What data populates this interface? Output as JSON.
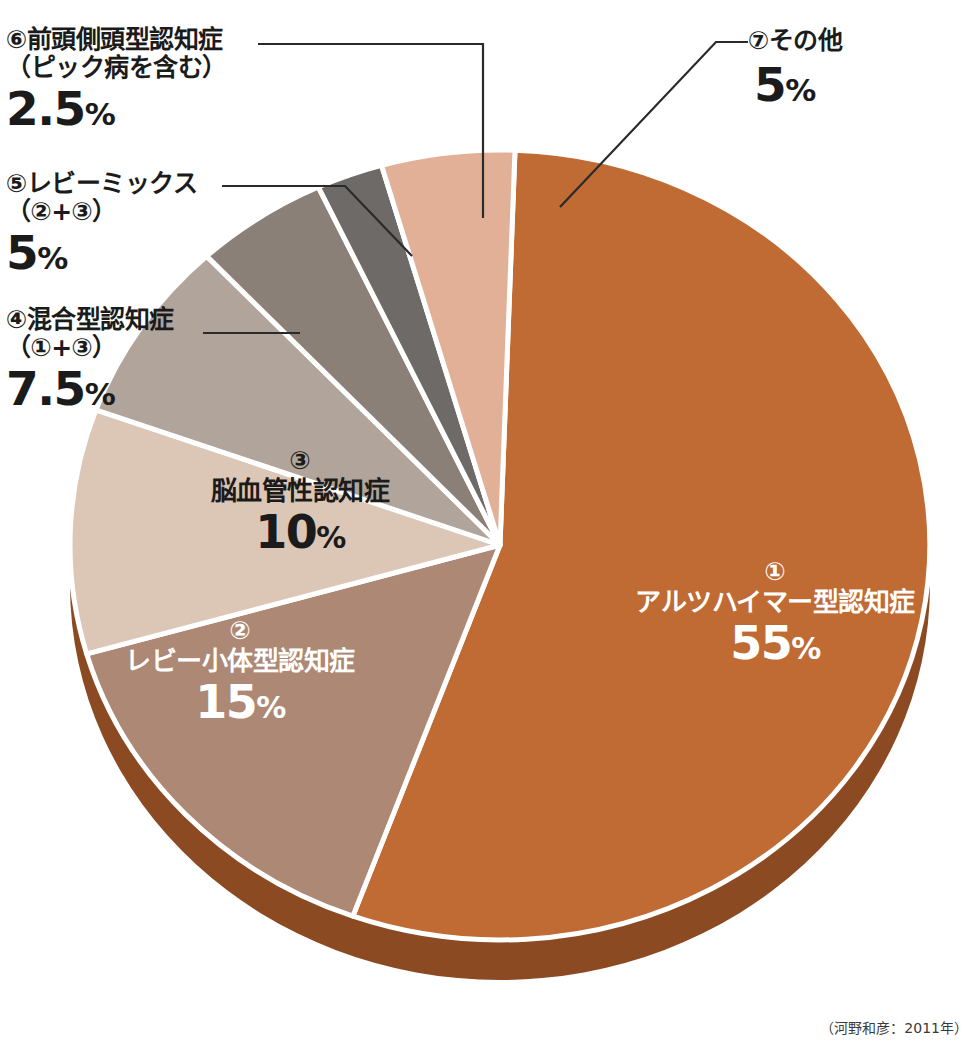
{
  "chart_data": {
    "type": "pie",
    "title": "",
    "subtitle": "",
    "xlabel": "",
    "ylabel": "",
    "legend_position": "none",
    "grid": false,
    "units": "%",
    "source": "（河野和彦：2011年）",
    "categories": [
      "①アルツハイマー型認知症",
      "②レビー小体型認知症",
      "③脳血管性認知症",
      "④混合型認知症（①+③）",
      "⑤レビーミックス（②+③）",
      "⑥前頭側頭型認知症（ピック病を含む）",
      "⑦その他"
    ],
    "values": [
      55,
      15,
      10,
      7.5,
      5,
      2.5,
      5
    ],
    "colors": [
      "#C06A34",
      "#AC8875",
      "#DCC6B6",
      "#B1A49B",
      "#8B8078",
      "#6E6A68",
      "#E1B096"
    ],
    "slices": [
      {
        "index": "①",
        "name": "アルツハイマー型認知症",
        "value": 55,
        "value_text": "55",
        "pct_symbol": "%",
        "color": "#C06A34",
        "label_placement": "inside",
        "label_color": "#ffffff"
      },
      {
        "index": "②",
        "name": "レビー小体型認知症",
        "value": 15,
        "value_text": "15",
        "pct_symbol": "%",
        "color": "#AC8875",
        "label_placement": "inside",
        "label_color": "#ffffff"
      },
      {
        "index": "③",
        "name": "脳血管性認知症",
        "value": 10,
        "value_text": "10",
        "pct_symbol": "%",
        "color": "#DCC6B6",
        "label_placement": "inside",
        "label_color": "#1b1b1b"
      },
      {
        "index": "④",
        "name": "混合型認知症",
        "name_line2": "（①+③）",
        "value": 7.5,
        "value_text": "7.5",
        "pct_symbol": "%",
        "color": "#B1A49B",
        "label_placement": "outside-left",
        "label_color": "#1b1b1b"
      },
      {
        "index": "⑤",
        "name": "レビーミックス",
        "name_line2": "（②+③）",
        "value": 5,
        "value_text": "5",
        "pct_symbol": "%",
        "color": "#8B8078",
        "label_placement": "outside-left",
        "label_color": "#1b1b1b"
      },
      {
        "index": "⑥",
        "name": "前頭側頭型認知症",
        "name_line2": "（ピック病を含む）",
        "value": 2.5,
        "value_text": "2.5",
        "pct_symbol": "%",
        "color": "#6E6A68",
        "label_placement": "outside-left",
        "label_color": "#1b1b1b"
      },
      {
        "index": "⑦",
        "name": "その他",
        "value": 5,
        "value_text": "5",
        "pct_symbol": "%",
        "color": "#E1B096",
        "label_placement": "outside-right",
        "label_color": "#1b1b1b"
      }
    ]
  },
  "callouts": {
    "c6": {
      "line1": "⑥前頭側頭型認知症",
      "line2": "（ピック病を含む）",
      "value": "2.5",
      "sym": "%"
    },
    "c5": {
      "line1": "⑤レビーミックス",
      "line2": "（②+③）",
      "value": "5",
      "sym": "%"
    },
    "c4": {
      "line1": "④混合型認知症",
      "line2": "（①+③）",
      "value": "7.5",
      "sym": "%"
    },
    "c7": {
      "line1": "⑦その他",
      "value": "5",
      "sym": "%"
    }
  },
  "inside_labels": {
    "s1": {
      "num": "①",
      "name": "アルツハイマー型認知症",
      "value": "55",
      "sym": "%"
    },
    "s2": {
      "num": "②",
      "name": "レビー小体型認知症",
      "value": "15",
      "sym": "%"
    },
    "s3": {
      "num": "③",
      "name": "脳血管性認知症",
      "value": "10",
      "sym": "%"
    }
  },
  "footer": {
    "source": "（河野和彦：2011年）"
  }
}
